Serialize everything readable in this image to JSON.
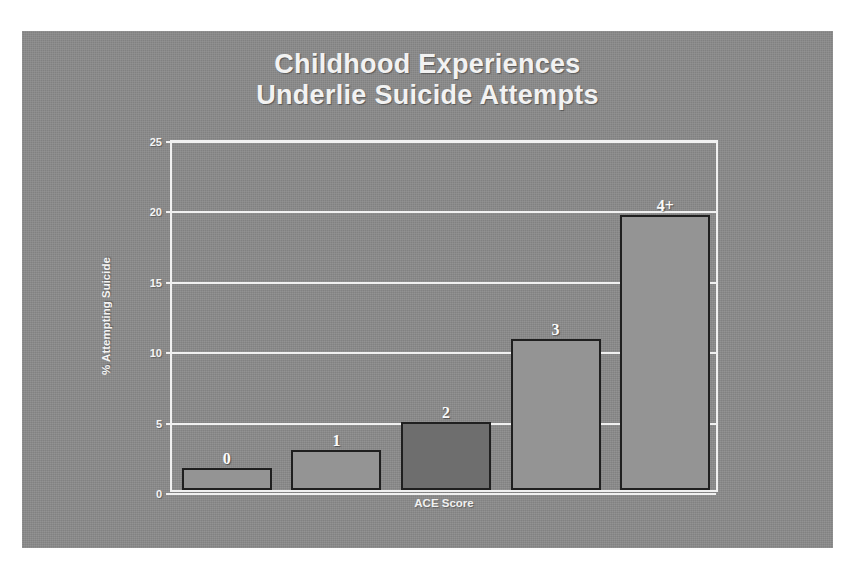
{
  "slide": {
    "background_color": "#8b8b8b",
    "title_lines": [
      "Childhood Experiences",
      "Underlie Suicide Attempts"
    ],
    "title_color": "#f2f2f2"
  },
  "chart_data": {
    "type": "bar",
    "title": "Childhood Experiences Underlie Suicide Attempts",
    "xlabel": "ACE Score",
    "ylabel": "% Attempting Suicide",
    "categories": [
      "0",
      "1",
      "2",
      "3",
      "4+"
    ],
    "values": [
      1.55,
      2.85,
      4.85,
      10.7,
      19.5
    ],
    "bar_labels": [
      "0",
      "1",
      "2",
      "3",
      "4+"
    ],
    "bar_fill_colors": [
      "#949494",
      "#949494",
      "#6e6e6e",
      "#949494",
      "#949494"
    ],
    "bar_border_color": "#1f1f1f",
    "ylim": [
      0,
      25
    ],
    "yticks": [
      0,
      5,
      10,
      15,
      20,
      25
    ],
    "ytick_labels": [
      "0",
      "5",
      "10",
      "15",
      "20",
      "25"
    ],
    "grid": true,
    "grid_color": "#f0f0f0",
    "legend": null,
    "legend_position": "none"
  }
}
